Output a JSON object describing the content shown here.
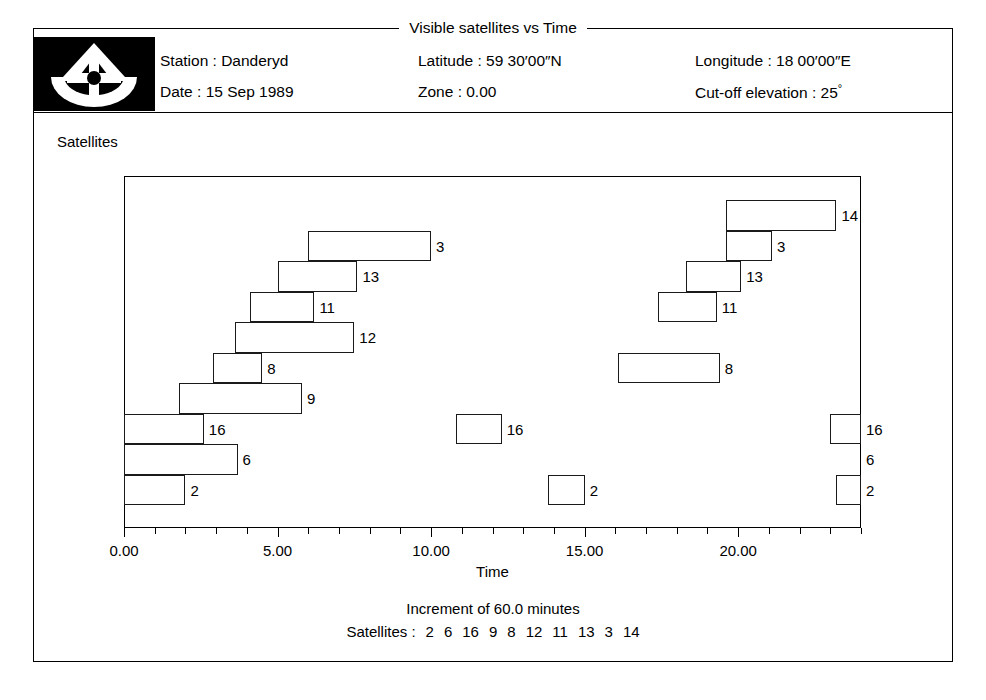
{
  "figure": {
    "title": "Visible satellites vs Time"
  },
  "logo": {
    "icon": "theodolite-compass-icon"
  },
  "header": {
    "rows": [
      {
        "c1": "Station : Danderyd",
        "c2": "Latitude : 59 30′00″N",
        "c3_pre": "Longitude : 18 00′00″E",
        "c3_deg": ""
      },
      {
        "c1": "Date : 15 Sep 1989",
        "c2": "Zone : 0.00",
        "c3_pre": "Cut-off elevation : 25",
        "c3_deg": "°"
      }
    ]
  },
  "plot": {
    "y_axis_label": "Satellites",
    "x_axis_label": "Time"
  },
  "caption": {
    "increment": "Increment of 60.0 minutes",
    "satellites_prefix": "Satellites :",
    "satellites_order": [
      "2",
      "6",
      "16",
      "9",
      "8",
      "12",
      "11",
      "13",
      "3",
      "14"
    ]
  },
  "chart_data": {
    "type": "bar",
    "chart_kind": "gantt-visibility",
    "title": "Visible satellites vs Time",
    "xlabel": "Time",
    "ylabel": "Satellites",
    "xlim": [
      0,
      24
    ],
    "xticks": [
      0,
      1,
      2,
      3,
      4,
      5,
      6,
      7,
      8,
      9,
      10,
      11,
      12,
      13,
      14,
      15,
      16,
      17,
      18,
      19,
      20,
      21,
      22,
      23,
      24
    ],
    "xtick_labels": [
      {
        "value": 0,
        "label": "0.00"
      },
      {
        "value": 5,
        "label": "5.00"
      },
      {
        "value": 10,
        "label": "10.00"
      },
      {
        "value": 15,
        "label": "15.00"
      },
      {
        "value": 20,
        "label": "20.00"
      }
    ],
    "grid": false,
    "legend": "none",
    "rows": [
      {
        "prn": "14",
        "row": 0,
        "label": "14",
        "intervals": [
          {
            "start": 19.6,
            "end": 23.2
          }
        ]
      },
      {
        "prn": "3",
        "row": 1,
        "label": "3",
        "intervals": [
          {
            "start": 6.0,
            "end": 10.0
          },
          {
            "start": 19.6,
            "end": 21.1
          }
        ]
      },
      {
        "prn": "13",
        "row": 2,
        "label": "13",
        "intervals": [
          {
            "start": 5.0,
            "end": 7.6
          },
          {
            "start": 18.3,
            "end": 20.1
          }
        ]
      },
      {
        "prn": "11",
        "row": 3,
        "label": "11",
        "intervals": [
          {
            "start": 4.1,
            "end": 6.2
          },
          {
            "start": 17.4,
            "end": 19.3
          }
        ]
      },
      {
        "prn": "12",
        "row": 4,
        "label": "12",
        "intervals": [
          {
            "start": 3.6,
            "end": 7.5
          }
        ]
      },
      {
        "prn": "8",
        "row": 5,
        "label": "8",
        "intervals": [
          {
            "start": 2.9,
            "end": 4.5
          },
          {
            "start": 16.1,
            "end": 19.4
          }
        ]
      },
      {
        "prn": "9",
        "row": 6,
        "label": "9",
        "intervals": [
          {
            "start": 1.8,
            "end": 5.8
          }
        ]
      },
      {
        "prn": "16",
        "row": 7,
        "label": "16",
        "intervals": [
          {
            "start": 0.0,
            "end": 2.6
          },
          {
            "start": 10.8,
            "end": 12.3
          },
          {
            "start": 23.0,
            "end": 24.0
          }
        ]
      },
      {
        "prn": "6",
        "row": 8,
        "label": "6",
        "intervals": [
          {
            "start": 0.0,
            "end": 3.7
          }
        ]
      },
      {
        "prn": "2",
        "row": 9,
        "label": "2",
        "intervals": [
          {
            "start": 0.0,
            "end": 2.0
          },
          {
            "start": 13.8,
            "end": 15.0
          },
          {
            "start": 23.2,
            "end": 24.0
          }
        ]
      }
    ]
  }
}
